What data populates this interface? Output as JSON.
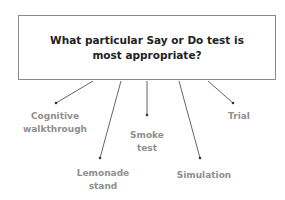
{
  "question": {
    "text": "What particular Say or Do test is most appropriate?"
  },
  "options": [
    {
      "label": "Cognitive walkthrough",
      "line": [
        93,
        81,
        56,
        103
      ],
      "label_pos": [
        55,
        110
      ]
    },
    {
      "label": "Lemonade stand",
      "line": [
        121,
        81,
        100,
        158
      ],
      "label_pos": [
        103,
        167
      ]
    },
    {
      "label": "Smoke test",
      "line": [
        147,
        81,
        147,
        115
      ],
      "label_pos": [
        147,
        129
      ]
    },
    {
      "label": "Simulation",
      "line": [
        179,
        81,
        200,
        158
      ],
      "label_pos": [
        204,
        169
      ]
    },
    {
      "label": "Trial",
      "line": [
        208,
        81,
        233,
        103
      ],
      "label_pos": [
        239,
        110
      ]
    }
  ],
  "colors": {
    "line": "#555555",
    "label": "#8f8f8f",
    "title": "#222222",
    "border": "#8a8a8a"
  }
}
